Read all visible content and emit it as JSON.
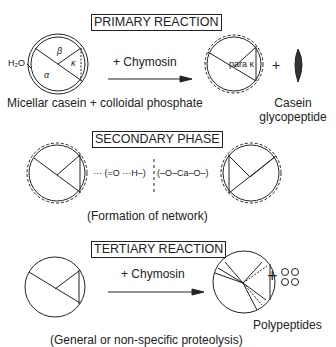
{
  "primary": {
    "title": "PRIMARY REACTION",
    "reagent": "+ Chymosin",
    "water_label": "H₂O",
    "segment_labels": {
      "beta": "β",
      "alpha": "α",
      "kappa": "κ"
    },
    "para_label": "para κ",
    "plus": "+",
    "left_caption": "Micellar casein + colloidal phosphate",
    "right_caption_line1": "Casein",
    "right_caption_line2": "glycopeptide"
  },
  "secondary": {
    "title": "SECONDARY PHASE",
    "bond_left": "··· (=O ···H–)",
    "bond_right": "(–O–Ca–O–)",
    "caption": "(Formation of network)"
  },
  "tertiary": {
    "title": "TERTIARY REACTION",
    "reagent": "+ Chymosin",
    "plus": "+",
    "product_label": "Polypeptides",
    "caption": "(General or non-specific proteolysis)"
  }
}
